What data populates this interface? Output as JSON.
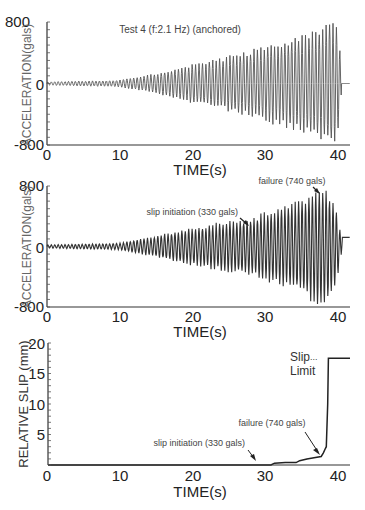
{
  "chart_data": [
    {
      "type": "line",
      "id": "top",
      "title": "Test 4 (f:2.1 Hz) (anchored)",
      "xlabel": "TIME(s)",
      "ylabel": "ACCELERATION(gals)",
      "xlim": [
        0,
        42
      ],
      "ylim": [
        -800,
        800
      ],
      "xticks": [
        0,
        10,
        20,
        30,
        40
      ],
      "yticks": [
        "800",
        "0",
        "-800"
      ],
      "ytick_values": [
        800,
        0,
        -800
      ],
      "frequency_hz": 2.1,
      "envelope": {
        "t": [
          0,
          10,
          15,
          20,
          25,
          30,
          35,
          38,
          40,
          40.6,
          41,
          42
        ],
        "amp": [
          20,
          40,
          120,
          230,
          330,
          450,
          580,
          680,
          790,
          400,
          0,
          0
        ]
      }
    },
    {
      "type": "line",
      "id": "middle",
      "xlabel": "TIME(s)",
      "ylabel": "ACCELERATION(gals)",
      "xlim": [
        0,
        42
      ],
      "ylim": [
        -800,
        800
      ],
      "xticks": [
        0,
        10,
        20,
        30,
        40
      ],
      "yticks": [
        "800",
        "0",
        "-800"
      ],
      "ytick_values": [
        800,
        0,
        -800
      ],
      "frequency_hz": 2.1,
      "annotations": [
        {
          "text": "slip initiation (330 gals)",
          "x": 28,
          "y": 330
        },
        {
          "text": "failure (740 gals)",
          "x": 38,
          "y": 740
        }
      ],
      "envelope": {
        "t": [
          0,
          10,
          15,
          20,
          25,
          28,
          32,
          35,
          37,
          38.5,
          40,
          40.6,
          41,
          42
        ],
        "amp": [
          20,
          40,
          130,
          230,
          310,
          340,
          480,
          560,
          700,
          760,
          500,
          200,
          120,
          120
        ]
      },
      "offset_after": {
        "t": 40.8,
        "value": 120
      }
    },
    {
      "type": "line",
      "id": "bottom",
      "xlabel": "TIME(s)",
      "ylabel": "RELATIVE SLIP (mm)",
      "xlim": [
        0,
        42
      ],
      "ylim": [
        0,
        20
      ],
      "xticks": [
        0,
        10,
        20,
        30,
        40
      ],
      "yticks": [
        "20",
        "15",
        "10",
        "5"
      ],
      "ytick_values": [
        20,
        15,
        10,
        5
      ],
      "x": [
        0,
        31,
        31.5,
        33,
        34.5,
        35,
        36,
        37,
        38,
        38.3,
        38.5,
        38.7,
        38.9,
        39,
        42
      ],
      "y": [
        0,
        0,
        0.3,
        0.4,
        0.4,
        0.7,
        1.0,
        1.2,
        1.4,
        2.0,
        2.5,
        3.0,
        10.0,
        17.5,
        17.5
      ],
      "annotations": [
        {
          "text": "slip initiation (330 gals)",
          "x": 29,
          "y": 0.2
        },
        {
          "text": "failure (740 gals)",
          "x": 38.3,
          "y": 1.6
        },
        {
          "text": "Slip",
          "x": 34,
          "y": 17.5
        },
        {
          "text": "Limit",
          "x": 34,
          "y": 16
        }
      ],
      "slip_limit": 17.5
    }
  ],
  "labels": {
    "top_title": "Test 4 (f:2.1 Hz) (anchored)",
    "xlabel": "TIME(s)",
    "acc_ylabel": "ACCELERATION(gals)",
    "slip_ylabel": "RELATIVE SLIP (mm)",
    "slip_init": "slip initiation (330 gals)",
    "failure": "failure (740 gals)",
    "slip_limit_1": "Slip",
    "slip_limit_2": "Limit",
    "slip_limit_dots": "..."
  }
}
